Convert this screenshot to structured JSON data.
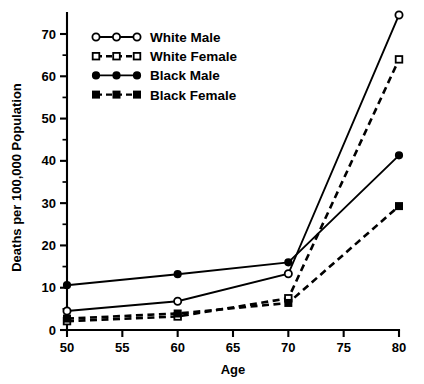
{
  "chart_data": {
    "type": "line",
    "title": "",
    "xlabel": "Age",
    "ylabel": "Deaths per 100,000 Population",
    "x": [
      50,
      60,
      70,
      80
    ],
    "xlim": [
      50,
      80
    ],
    "ylim": [
      0,
      75
    ],
    "x_ticks": [
      50,
      55,
      60,
      65,
      70,
      75,
      80
    ],
    "x_tick_labels": [
      "50",
      "55",
      "60",
      "65",
      "70",
      "75",
      "80"
    ],
    "y_ticks": [
      0,
      10,
      20,
      30,
      40,
      50,
      60,
      70
    ],
    "y_tick_labels": [
      "0",
      "10",
      "20",
      "30",
      "40",
      "50",
      "60",
      "70"
    ],
    "y_minor_ticks": [
      5,
      15,
      25,
      35,
      45,
      55,
      65,
      75
    ],
    "grid": false,
    "legend_position": "upper left",
    "series": [
      {
        "name": "White Male",
        "values": [
          4.5,
          6.8,
          13.3,
          74.5
        ],
        "marker": "open-circle",
        "linestyle": "solid"
      },
      {
        "name": "White Female",
        "values": [
          2.1,
          3.2,
          7.5,
          64.0
        ],
        "marker": "open-square",
        "linestyle": "dashed"
      },
      {
        "name": "Black Male",
        "values": [
          10.6,
          13.2,
          16.0,
          41.3
        ],
        "marker": "filled-circle",
        "linestyle": "solid"
      },
      {
        "name": "Black Female",
        "values": [
          2.7,
          3.9,
          6.4,
          29.3
        ],
        "marker": "filled-square",
        "linestyle": "dashed"
      }
    ]
  },
  "legend": {
    "entries": [
      {
        "label": "White Male"
      },
      {
        "label": "White Female"
      },
      {
        "label": "Black Male"
      },
      {
        "label": "Black Female"
      }
    ]
  },
  "colors": {
    "foreground": "#000000",
    "background": "#ffffff"
  }
}
